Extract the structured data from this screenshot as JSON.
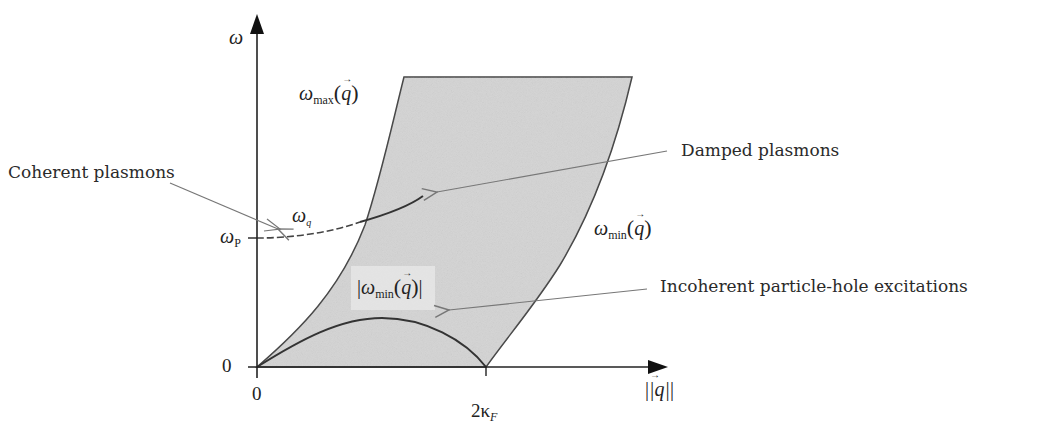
{
  "diagram": {
    "axes": {
      "y_label": "ω",
      "x_label": "|q|",
      "origin_x_tick": "0",
      "origin_y_tick": "0",
      "x_tick_2kF": "2κ",
      "x_tick_2kF_sub": "F",
      "y_tick_wp": "ω",
      "y_tick_wp_sub": "P"
    },
    "curves": {
      "omega_max": {
        "symbol": "ω",
        "sub": "max",
        "arg": "q"
      },
      "omega_min": {
        "symbol": "ω",
        "sub": "min",
        "arg": "q"
      },
      "abs_omega_min": {
        "symbol": "ω",
        "sub": "min",
        "arg": "q"
      },
      "plasmon": {
        "symbol": "ω",
        "sub": "q"
      }
    },
    "annotations": {
      "coherent": "Coherent plasmons",
      "damped": "Damped plasmons",
      "incoherent": "Incoherent particle-hole excitations"
    },
    "colors": {
      "region_fill": "#d4d4d4",
      "line": "#333333",
      "arrow": "#777777"
    }
  }
}
